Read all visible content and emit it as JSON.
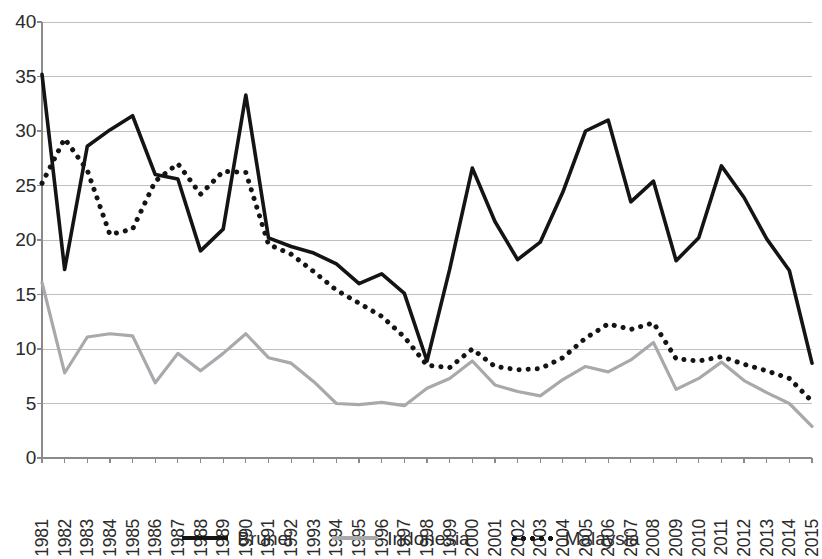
{
  "chart_data": {
    "type": "line",
    "title": "",
    "xlabel": "",
    "ylabel": "",
    "ylim": [
      0,
      40
    ],
    "ytick_values": [
      0,
      5,
      10,
      15,
      20,
      25,
      30,
      35,
      40
    ],
    "grid": true,
    "legend_position": "bottom",
    "x": [
      1981,
      1982,
      1983,
      1984,
      1985,
      1986,
      1987,
      1988,
      1989,
      1990,
      1991,
      1992,
      1993,
      1994,
      1995,
      1996,
      1997,
      1998,
      1999,
      2000,
      2001,
      2002,
      2003,
      2004,
      2005,
      2006,
      2007,
      2008,
      2009,
      2010,
      2011,
      2012,
      2013,
      2014,
      2015
    ],
    "series": [
      {
        "name": "Brunei",
        "color": "#141414",
        "style": "solid",
        "values": [
          35.2,
          17.3,
          28.6,
          30.1,
          31.4,
          26.0,
          25.6,
          19.0,
          21.0,
          33.3,
          20.2,
          19.4,
          18.8,
          17.8,
          16.0,
          16.9,
          15.1,
          8.9,
          17.3,
          26.6,
          21.7,
          18.2,
          19.8,
          24.4,
          30.0,
          31.0,
          23.5,
          25.4,
          18.1,
          20.2,
          26.8,
          23.9,
          20.1,
          17.2,
          8.7
        ]
      },
      {
        "name": "Indonesia",
        "color": "#a7a9ac",
        "style": "solid",
        "values": [
          16.1,
          7.8,
          11.1,
          11.4,
          11.2,
          6.9,
          9.6,
          8.0,
          9.6,
          11.4,
          9.2,
          8.7,
          7.0,
          5.0,
          4.9,
          5.1,
          4.8,
          6.4,
          7.3,
          8.9,
          6.7,
          6.1,
          5.7,
          7.2,
          8.4,
          7.9,
          9.0,
          10.6,
          6.3,
          7.3,
          8.8,
          7.1,
          6.0,
          5.0,
          2.9
        ]
      },
      {
        "name": "Malaysia",
        "color": "#141414",
        "style": "dotted",
        "values": [
          25.2,
          29.3,
          26.4,
          20.5,
          21.0,
          25.4,
          27.0,
          24.2,
          26.3,
          26.2,
          19.6,
          18.7,
          17.1,
          15.4,
          14.2,
          13.0,
          11.1,
          8.5,
          8.3,
          10.0,
          8.4,
          8.1,
          8.2,
          9.2,
          11.0,
          12.3,
          11.8,
          12.4,
          9.1,
          8.9,
          9.3,
          8.6,
          8.0,
          7.3,
          5.2
        ]
      }
    ]
  },
  "legend": {
    "items": [
      {
        "label": "Brunei",
        "swatch": "solid-brunei"
      },
      {
        "label": "Indonesia",
        "swatch": "solid-indonesia"
      },
      {
        "label": "Malaysia",
        "swatch": "dotted-malaysia"
      }
    ]
  },
  "axes": {
    "y_labels": [
      "40",
      "35",
      "30",
      "25",
      "20",
      "15",
      "10",
      "5",
      "0"
    ],
    "x_labels": [
      "1981",
      "1982",
      "1983",
      "1984",
      "1985",
      "1986",
      "1987",
      "1988",
      "1989",
      "1990",
      "1991",
      "1992",
      "1993",
      "1994",
      "1995",
      "1996",
      "1997",
      "1998",
      "1999",
      "2000",
      "2001",
      "2002",
      "2003",
      "2004",
      "2005",
      "2006",
      "2007",
      "2008",
      "2009",
      "2010",
      "2011",
      "2012",
      "2013",
      "2014",
      "2015"
    ]
  },
  "colors": {
    "axis": "#8a8a8a",
    "grid": "#bfbfbf",
    "brunei": "#141414",
    "indonesia": "#a7a9ac",
    "malaysia": "#141414",
    "text": "#2b2b2b"
  }
}
